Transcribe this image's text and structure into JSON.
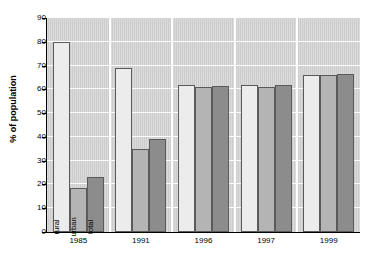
{
  "chart_data": {
    "type": "bar",
    "title": "",
    "subtitle": "",
    "xlabel": "",
    "ylabel": "% of population",
    "categories": [
      "1985",
      "1991",
      "1996",
      "1997",
      "1999"
    ],
    "ylim": [
      0,
      90
    ],
    "yticks": [
      0,
      10,
      20,
      30,
      40,
      50,
      60,
      70,
      80,
      90
    ],
    "grid": "horizontal",
    "legend_position": "in-bar-labels",
    "series": [
      {
        "name": "rural",
        "values": [
          80,
          69,
          62,
          62,
          66
        ],
        "color": "#ececec"
      },
      {
        "name": "urban",
        "values": [
          18.5,
          35,
          61,
          61,
          66
        ],
        "color": "#b4b4b4"
      },
      {
        "name": "total",
        "values": [
          23,
          39,
          61.5,
          62,
          66.5
        ],
        "color": "#8c8c8c"
      }
    ],
    "inbar_labels": [
      "rural",
      "urban",
      "total"
    ],
    "inbar_label_group": "1985",
    "plot_background": "#cccccc",
    "gridline_color": "#ffffff",
    "axis_color": "#000000"
  },
  "axis": {
    "y": {
      "title": "% of population",
      "ticks": [
        "90",
        "80",
        "70",
        "60",
        "50",
        "40",
        "30",
        "20",
        "10",
        "0"
      ]
    },
    "x": {
      "ticks": [
        "1985",
        "1991",
        "1996",
        "1997",
        "1999"
      ]
    }
  }
}
